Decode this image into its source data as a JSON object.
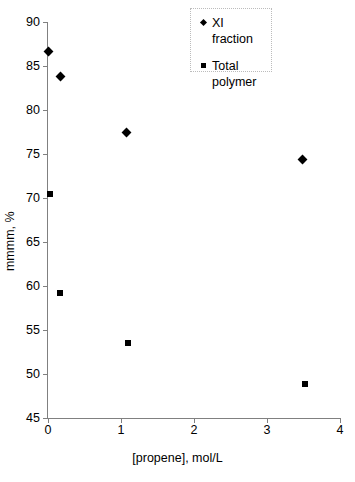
{
  "chart_data": {
    "type": "scatter",
    "title": "",
    "xlabel": "[propene], mol/L",
    "ylabel": "mmmm, %",
    "xlim": [
      0,
      4
    ],
    "ylim": [
      45,
      90
    ],
    "xticks": [
      "0",
      "1",
      "2",
      "3",
      "4"
    ],
    "yticks": [
      "45",
      "50",
      "55",
      "60",
      "65",
      "70",
      "75",
      "80",
      "85",
      "90"
    ],
    "grid": false,
    "legend_position": "top-right",
    "series": [
      {
        "name": "XI fraction",
        "marker": "diamond",
        "color": "#000000",
        "points": [
          {
            "x": 0.0,
            "y": 86.6
          },
          {
            "x": 0.17,
            "y": 83.8
          },
          {
            "x": 1.08,
            "y": 77.4
          },
          {
            "x": 3.49,
            "y": 74.4
          }
        ]
      },
      {
        "name": "Total polymer",
        "marker": "square",
        "color": "#000000",
        "points": [
          {
            "x": 0.03,
            "y": 70.5
          },
          {
            "x": 0.17,
            "y": 59.2
          },
          {
            "x": 1.1,
            "y": 53.5
          },
          {
            "x": 3.52,
            "y": 48.9
          }
        ]
      }
    ]
  },
  "legend": {
    "entries": [
      {
        "label": "XI fraction",
        "marker": "diamond"
      },
      {
        "label": "Total polymer",
        "marker": "square"
      }
    ]
  },
  "axes": {
    "x_title": "[propene], mol/L",
    "y_title": "mmmm, %"
  }
}
